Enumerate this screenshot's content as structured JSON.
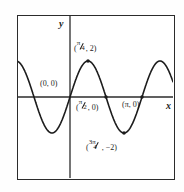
{
  "figure": {
    "kind": "coordinate-plane-graph",
    "background_color": "#fefefe",
    "frame_color": "#2b2b2b",
    "curve_color": "#1c1c1c"
  },
  "axes": {
    "x_label": "x",
    "y_label": "y"
  },
  "labels": {
    "maximum": {
      "text": "(π/4, 2)",
      "open_paren": "(",
      "numerator": "π",
      "denominator": "4",
      "tail": ", 2)"
    },
    "origin": {
      "text": "(0, 0)"
    },
    "half_pi_root": {
      "text": "(π/2, 0)",
      "open_paren": "(",
      "numerator": "π",
      "denominator": "2",
      "tail": ", 0)"
    },
    "pi_root": {
      "text": "(π, 0)"
    },
    "minimum": {
      "text": "(3π/4, −2)",
      "open_paren": "(",
      "numerator": "3π",
      "denominator": "4",
      "tail": ", −2)"
    }
  },
  "chart_data": {
    "type": "line",
    "title": "",
    "xlabel": "x",
    "ylabel": "y",
    "function": "y = 2 sin(2x)",
    "amplitude": 2,
    "period": "π",
    "grid": false,
    "legend_position": "none",
    "xlim": [
      "-3π/4",
      "5π/4"
    ],
    "ylim": [
      -2.6,
      2.6
    ],
    "annotations": [
      {
        "label": "(π/4, 2)",
        "x": 0.7853981634,
        "y": 2
      },
      {
        "label": "(0, 0)",
        "x": 0,
        "y": 0
      },
      {
        "label": "(π/2, 0)",
        "x": 1.5707963268,
        "y": 0
      },
      {
        "label": "(π, 0)",
        "x": 3.1415926536,
        "y": 0
      },
      {
        "label": "(3π/4, −2)",
        "x": 2.3561944902,
        "y": -2
      }
    ],
    "marked_points": [
      {
        "x": 0.7853981634,
        "y": 2
      },
      {
        "x": 1.5707963268,
        "y": 0
      },
      {
        "x": 3.1415926536,
        "y": 0
      },
      {
        "x": 2.3561944902,
        "y": -2
      }
    ],
    "x": [
      -2.3561944902,
      -2.1598449493,
      -1.9634954085,
      -1.7671458676,
      -1.5707963268,
      -1.3744467859,
      -1.1780972451,
      -0.9817477042,
      -0.7853981634,
      -0.5890486225,
      -0.3926990817,
      -0.1963495408,
      0,
      0.1963495408,
      0.3926990817,
      0.5890486225,
      0.7853981634,
      0.9817477042,
      1.1780972451,
      1.3744467859,
      1.5707963268,
      1.7671458676,
      1.9634954085,
      2.1598449493,
      2.3561944902,
      2.5525440311,
      2.7488935719,
      2.9452431128,
      3.1415926536,
      3.3379421944,
      3.5342917353,
      3.7306412762,
      3.926990817
    ],
    "values": [
      2,
      1.847759065,
      1.4142135624,
      0.7653668647,
      0,
      -0.7653668647,
      -1.4142135624,
      -1.847759065,
      -2,
      -1.847759065,
      -1.4142135624,
      -0.7653668647,
      0,
      0.7653668647,
      1.4142135624,
      1.847759065,
      2,
      1.847759065,
      1.4142135624,
      0.7653668647,
      0,
      -0.7653668647,
      -1.4142135624,
      -1.847759065,
      -2,
      -1.847759065,
      -1.4142135624,
      -0.7653668647,
      0,
      0.7653668647,
      1.4142135624,
      1.847759065,
      2
    ]
  }
}
